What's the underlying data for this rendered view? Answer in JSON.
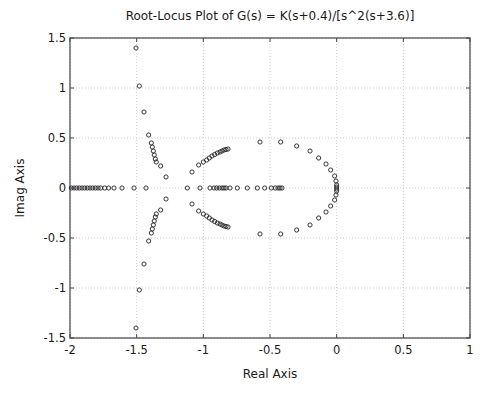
{
  "chart_data": {
    "type": "scatter",
    "title": "Root-Locus Plot of G(s) = K(s+0.4)/[s^2(s+3.6)]",
    "xlabel": "Real Axis",
    "ylabel": "Imag Axis",
    "xlim": [
      -2,
      1
    ],
    "ylim": [
      -1.5,
      1.5
    ],
    "xticks": [
      -2,
      -1.5,
      -1,
      -0.5,
      0,
      0.5,
      1
    ],
    "xtick_labels": [
      "-2",
      "-1.5",
      "-1",
      "-0.5",
      "0",
      "0.5",
      "1"
    ],
    "yticks": [
      -1.5,
      -1,
      -0.5,
      0,
      0.5,
      1,
      1.5
    ],
    "ytick_labels": [
      "-1.5",
      "-1",
      "-0.5",
      "0",
      "0.5",
      "1",
      "1.5"
    ],
    "grid": true,
    "marker": "circle-open",
    "marker_color": "#222222",
    "series": [
      {
        "name": "Branch far-left (upper, to asymptote)",
        "points": [
          [
            -1.505,
            1.4
          ],
          [
            -1.48,
            1.02
          ],
          [
            -1.445,
            0.76
          ],
          [
            -1.41,
            0.53
          ],
          [
            -1.39,
            0.45
          ],
          [
            -1.383,
            0.41
          ],
          [
            -1.375,
            0.37
          ],
          [
            -1.368,
            0.33
          ],
          [
            -1.36,
            0.29
          ],
          [
            -1.353,
            0.26
          ],
          [
            -1.32,
            0.22
          ],
          [
            -1.28,
            0.11
          ]
        ]
      },
      {
        "name": "Branch far-left (lower, to asymptote)",
        "points": [
          [
            -1.505,
            -1.4
          ],
          [
            -1.48,
            -1.02
          ],
          [
            -1.445,
            -0.76
          ],
          [
            -1.41,
            -0.53
          ],
          [
            -1.39,
            -0.45
          ],
          [
            -1.383,
            -0.41
          ],
          [
            -1.375,
            -0.37
          ],
          [
            -1.368,
            -0.33
          ],
          [
            -1.36,
            -0.29
          ],
          [
            -1.353,
            -0.26
          ],
          [
            -1.32,
            -0.22
          ],
          [
            -1.28,
            -0.11
          ]
        ]
      },
      {
        "name": "Real-axis (left of -1.5)",
        "points": [
          [
            -1.99,
            0
          ],
          [
            -1.97,
            0
          ],
          [
            -1.95,
            0
          ],
          [
            -1.93,
            0
          ],
          [
            -1.91,
            0
          ],
          [
            -1.89,
            0
          ],
          [
            -1.87,
            0
          ],
          [
            -1.85,
            0
          ],
          [
            -1.83,
            0
          ],
          [
            -1.81,
            0
          ],
          [
            -1.79,
            0
          ],
          [
            -1.77,
            0
          ],
          [
            -1.74,
            0
          ],
          [
            -1.71,
            0
          ],
          [
            -1.67,
            0
          ],
          [
            -1.61,
            0
          ],
          [
            -1.52,
            0
          ],
          [
            -1.43,
            0
          ]
        ]
      },
      {
        "name": "Branch middle (upper)",
        "points": [
          [
            -1.085,
            0.16
          ],
          [
            -1.035,
            0.23
          ],
          [
            -1.0,
            0.26
          ],
          [
            -0.975,
            0.28
          ],
          [
            -0.955,
            0.3
          ],
          [
            -0.935,
            0.32
          ],
          [
            -0.915,
            0.335
          ],
          [
            -0.895,
            0.35
          ],
          [
            -0.875,
            0.36
          ],
          [
            -0.86,
            0.37
          ],
          [
            -0.845,
            0.38
          ],
          [
            -0.83,
            0.385
          ],
          [
            -0.815,
            0.39
          ]
        ]
      },
      {
        "name": "Branch middle (lower)",
        "points": [
          [
            -1.085,
            -0.16
          ],
          [
            -1.035,
            -0.23
          ],
          [
            -1.0,
            -0.26
          ],
          [
            -0.975,
            -0.28
          ],
          [
            -0.955,
            -0.3
          ],
          [
            -0.935,
            -0.32
          ],
          [
            -0.915,
            -0.335
          ],
          [
            -0.895,
            -0.35
          ],
          [
            -0.875,
            -0.36
          ],
          [
            -0.86,
            -0.37
          ],
          [
            -0.845,
            -0.38
          ],
          [
            -0.83,
            -0.385
          ],
          [
            -0.815,
            -0.39
          ]
        ]
      },
      {
        "name": "Real-axis (between -1.2 and -0.4)",
        "points": [
          [
            -1.12,
            0
          ],
          [
            -1.025,
            0
          ],
          [
            -0.95,
            0
          ],
          [
            -0.92,
            0
          ],
          [
            -0.9,
            0
          ],
          [
            -0.88,
            0
          ],
          [
            -0.86,
            0
          ],
          [
            -0.845,
            0
          ],
          [
            -0.83,
            0
          ],
          [
            -0.8,
            0
          ],
          [
            -0.745,
            0
          ],
          [
            -0.67,
            0
          ],
          [
            -0.595,
            0
          ],
          [
            -0.54,
            0
          ],
          [
            -0.49,
            0
          ],
          [
            -0.46,
            0
          ],
          [
            -0.44,
            0
          ],
          [
            -0.425,
            0
          ],
          [
            -0.41,
            0
          ]
        ]
      },
      {
        "name": "Circle branch (upper, from origin)",
        "points": [
          [
            -0.575,
            0.46
          ],
          [
            -0.42,
            0.46
          ],
          [
            -0.3,
            0.42
          ],
          [
            -0.2,
            0.37
          ],
          [
            -0.135,
            0.3
          ],
          [
            -0.08,
            0.24
          ],
          [
            -0.045,
            0.18
          ],
          [
            -0.015,
            0.12
          ],
          [
            -0.005,
            0.07
          ],
          [
            0.0,
            0.03
          ],
          [
            0.0,
            0.01
          ]
        ]
      },
      {
        "name": "Circle branch (lower, from origin)",
        "points": [
          [
            -0.575,
            -0.46
          ],
          [
            -0.42,
            -0.46
          ],
          [
            -0.3,
            -0.42
          ],
          [
            -0.2,
            -0.37
          ],
          [
            -0.135,
            -0.3
          ],
          [
            -0.08,
            -0.24
          ],
          [
            -0.045,
            -0.18
          ],
          [
            -0.015,
            -0.12
          ],
          [
            -0.005,
            -0.07
          ],
          [
            0.0,
            -0.03
          ],
          [
            0.0,
            -0.01
          ]
        ]
      }
    ]
  },
  "plot_area_px": {
    "left": 70,
    "top": 38,
    "right": 470,
    "bottom": 338
  },
  "colors": {
    "axis": "#444444",
    "grid": "#cfcfcf",
    "marker": "#222222",
    "background": "#ffffff"
  }
}
